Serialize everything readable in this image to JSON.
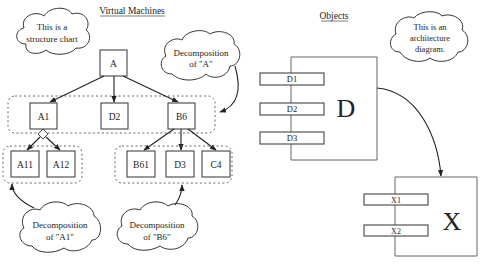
{
  "titles": {
    "left": "Virtual Machines",
    "right": "Objects"
  },
  "structure_chart": {
    "root": "A",
    "level1": [
      "A1",
      "D2",
      "B6"
    ],
    "a1_children": [
      "A11",
      "A12"
    ],
    "b6_children": [
      "B61",
      "D3",
      "C4"
    ]
  },
  "clouds": {
    "structure_note": [
      "This is a",
      "structure chart"
    ],
    "decomp_a": [
      "Decomposition",
      "of \"A\""
    ],
    "decomp_a1": [
      "Decomposition",
      "of \"A1\""
    ],
    "decomp_b6": [
      "Decomposition",
      "of \"B6\""
    ],
    "architecture_note": [
      "This is an",
      "architecture",
      "diagram."
    ]
  },
  "objects": {
    "d": {
      "label": "D",
      "ports": [
        "D1",
        "D2",
        "D3"
      ]
    },
    "x": {
      "label": "X",
      "ports": [
        "X1",
        "X2"
      ]
    }
  }
}
